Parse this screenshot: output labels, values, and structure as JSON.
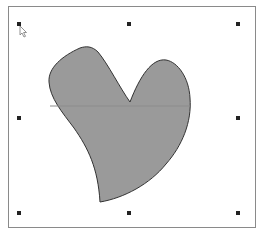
{
  "canvas": {
    "background": "#ffffff",
    "border_color": "#8a8a8a"
  },
  "shape": {
    "type": "heart-like freeform shape",
    "fill": "#9a9a9a",
    "stroke": "#333333",
    "selected": true
  },
  "selection": {
    "handle_color": "#222222",
    "handles": [
      "top-left",
      "top-center",
      "top-right",
      "middle-left",
      "middle-right",
      "bottom-left",
      "bottom-center",
      "bottom-right"
    ]
  },
  "icons": {
    "cursor": "arrow-pointer-icon"
  }
}
